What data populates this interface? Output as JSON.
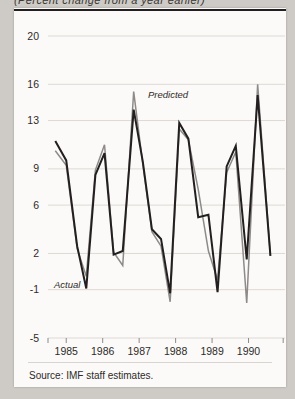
{
  "figure": {
    "clipped_title": "(Percent change from a year earlier)",
    "source_note": "Source: IMF staff estimates.",
    "background_color": "#cecbc6",
    "card_color": "#fbfaf8"
  },
  "annotations": {
    "actual_label": "Actual",
    "predicted_label": "Predicted"
  },
  "chart_data": {
    "type": "line",
    "title": "",
    "xlabel": "",
    "ylabel": "",
    "ylim": [
      -5,
      20
    ],
    "xlim": [
      1984.5,
      1991.0
    ],
    "grid": true,
    "legend": "inline-annotations",
    "ytick_labels": [
      "20",
      "16",
      "13",
      "9",
      "6",
      "2",
      "-1",
      "-5"
    ],
    "ytick_values": [
      20,
      16,
      13,
      9,
      6,
      2,
      -1,
      -5
    ],
    "xtick_labels": [
      "1985",
      "1986",
      "1987",
      "1988",
      "1989",
      "1990"
    ],
    "xtick_values": [
      1985,
      1986,
      1987,
      1988,
      1989,
      1990
    ],
    "colors": {
      "actual": "#231f20",
      "predicted": "#8d8a88",
      "grid": "#ded9d4",
      "axis": "#8d8a88"
    },
    "series": [
      {
        "name": "Actual",
        "color": "#231f20",
        "x": [
          1984.7,
          1985.0,
          1985.3,
          1985.55,
          1985.8,
          1986.05,
          1986.3,
          1986.55,
          1986.85,
          1987.1,
          1987.35,
          1987.6,
          1987.85,
          1988.1,
          1988.35,
          1988.62,
          1988.9,
          1989.15,
          1989.4,
          1989.65,
          1989.95,
          1990.25,
          1990.6
        ],
        "values": [
          11.3,
          9.7,
          2.6,
          -0.9,
          8.5,
          10.3,
          1.9,
          2.2,
          13.9,
          9.6,
          4.0,
          3.2,
          -1.3,
          12.8,
          11.5,
          5.0,
          5.2,
          -1.2,
          9.2,
          10.9,
          1.5,
          15.1,
          1.8
        ]
      },
      {
        "name": "Predicted",
        "color": "#8d8a88",
        "x": [
          1984.7,
          1985.0,
          1985.3,
          1985.55,
          1985.8,
          1986.05,
          1986.3,
          1986.55,
          1986.85,
          1987.1,
          1987.35,
          1987.6,
          1987.85,
          1988.1,
          1988.35,
          1988.62,
          1988.9,
          1989.15,
          1989.4,
          1989.65,
          1989.95,
          1990.25,
          1990.6
        ],
        "values": [
          10.5,
          9.3,
          2.4,
          0.1,
          8.9,
          11.0,
          2.1,
          1.0,
          15.4,
          9.4,
          3.8,
          2.6,
          -2.0,
          12.3,
          11.4,
          7.3,
          2.2,
          -0.2,
          8.7,
          10.4,
          -2.1,
          16.0,
          1.8
        ]
      }
    ]
  }
}
